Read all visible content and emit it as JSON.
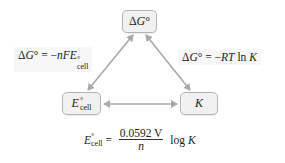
{
  "diagram": {
    "nodes": {
      "delta_g": {
        "symbol": "ΔG",
        "italic": "G",
        "prefix": "Δ",
        "degree": "°"
      },
      "e_cell": {
        "symbol": "E",
        "degree": "°",
        "subscript": "cell"
      },
      "k": {
        "symbol": "K"
      }
    },
    "relations": {
      "g_to_e": {
        "lhs_prefix": "Δ",
        "lhs_var": "G",
        "degree": "°",
        "equals": " = ",
        "rhs_sign": "−",
        "rhs_var": "nFE",
        "rhs_degree": "°",
        "rhs_sub": "cell"
      },
      "g_to_k": {
        "lhs_prefix": "Δ",
        "lhs_var": "G",
        "degree": "°",
        "equals": " = ",
        "rhs_sign": "−",
        "rhs_var": "RT",
        "rhs_fn": " ln ",
        "rhs_var2": "K"
      },
      "e_to_k": {
        "lhs_var": "E",
        "degree": "°",
        "lhs_sub": "cell",
        "equals": " = ",
        "numerator": "0.0592 V",
        "denominator": "n",
        "rhs_fn": " log ",
        "rhs_var": "K"
      }
    },
    "colors": {
      "arrow": "#a9a9a9",
      "node_fill": "#f1f1f1",
      "node_border": "#b4b4b4"
    }
  }
}
